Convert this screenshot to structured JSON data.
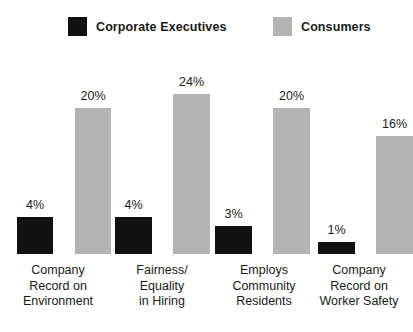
{
  "legend": {
    "items": [
      {
        "label": "Corporate Executives",
        "color": "#111111",
        "key": "executives"
      },
      {
        "label": "Consumers",
        "color": "#b3b3b3",
        "key": "consumers"
      }
    ]
  },
  "chart_data": {
    "type": "bar",
    "title": "",
    "subtitle": "",
    "xlabel": "",
    "ylabel": "",
    "grid": false,
    "legend_position": "top",
    "value_suffix": "%",
    "categories": [
      "Company Record on Environment",
      "Fairness/ Equality in Hiring",
      "Employs Community Residents",
      "Company Record on Worker Safety"
    ],
    "category_lines": [
      [
        "Company",
        "Record on",
        "Environment"
      ],
      [
        "Fairness/",
        "Equality",
        "in Hiring"
      ],
      [
        "Employs",
        "Community",
        "Residents"
      ],
      [
        "Company",
        "Record on",
        "Worker Safety"
      ]
    ],
    "series": [
      {
        "name": "Corporate Executives",
        "color": "#111111",
        "values": [
          4,
          4,
          3,
          1
        ],
        "labels": [
          "4%",
          "4%",
          "3%",
          "1%"
        ]
      },
      {
        "name": "Consumers",
        "color": "#b3b3b3",
        "values": [
          20,
          24,
          20,
          16
        ],
        "labels": [
          "20%",
          "24%",
          "20%",
          "16%"
        ]
      }
    ]
  },
  "render": {
    "baseline_y": 254,
    "plot_top_y": 60,
    "group_left": [
      17,
      115,
      215,
      318
    ],
    "bar_width": [
      36,
      37,
      37,
      37
    ],
    "gray_offset": [
      58,
      58,
      58,
      58
    ],
    "bar_pixel_heights": {
      "executives": [
        37,
        37,
        28,
        12
      ],
      "consumers": [
        146,
        160,
        146,
        118
      ]
    },
    "cat_left": [
      4,
      112,
      209,
      309
    ],
    "cat_width": [
      108,
      100,
      110,
      100
    ]
  }
}
